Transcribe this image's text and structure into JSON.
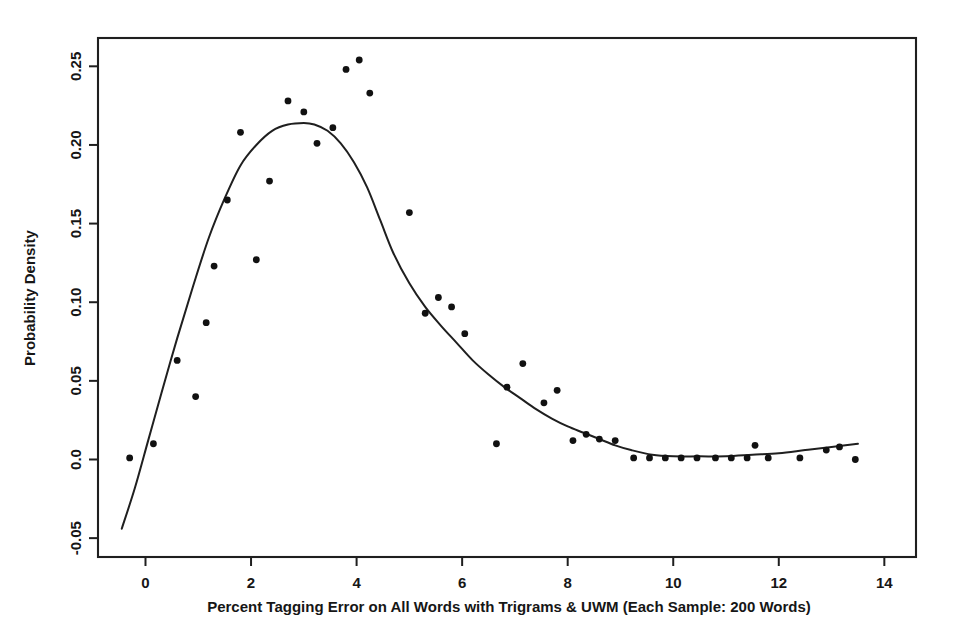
{
  "chart_data": {
    "type": "scatter",
    "title": "",
    "subtitle": "",
    "xlabel": "Percent Tagging Error on All Words with Trigrams & UWM (Each Sample: 200 Words)",
    "ylabel": "Probability Density",
    "xlim": [
      -0.9,
      14.6
    ],
    "ylim": [
      -0.062,
      0.268
    ],
    "grid": false,
    "legend": null,
    "xticks": [
      0,
      2,
      4,
      6,
      8,
      10,
      12,
      14
    ],
    "xtick_labels": [
      "0",
      "2",
      "4",
      "6",
      "8",
      "10",
      "12",
      "14"
    ],
    "yticks": [
      -0.05,
      0.0,
      0.05,
      0.1,
      0.15,
      0.2,
      0.25
    ],
    "ytick_labels": [
      "-0.05",
      "0.0",
      "0.05",
      "0.10",
      "0.15",
      "0.20",
      "0.25"
    ],
    "marker_color": "#111111",
    "line_color": "#1f1f1f",
    "frame_color": "#1f1f1f",
    "background_color": "#ffffff",
    "series": [
      {
        "name": "Empirical density points",
        "type": "scatter",
        "points": [
          [
            -0.3,
            0.001
          ],
          [
            0.15,
            0.01
          ],
          [
            0.6,
            0.063
          ],
          [
            0.95,
            0.04
          ],
          [
            1.15,
            0.087
          ],
          [
            1.3,
            0.123
          ],
          [
            1.55,
            0.165
          ],
          [
            1.8,
            0.208
          ],
          [
            2.1,
            0.127
          ],
          [
            2.35,
            0.177
          ],
          [
            2.7,
            0.228
          ],
          [
            3.0,
            0.221
          ],
          [
            3.25,
            0.201
          ],
          [
            3.55,
            0.211
          ],
          [
            3.8,
            0.248
          ],
          [
            4.05,
            0.254
          ],
          [
            4.25,
            0.233
          ],
          [
            5.0,
            0.157
          ],
          [
            5.3,
            0.093
          ],
          [
            5.55,
            0.103
          ],
          [
            5.8,
            0.097
          ],
          [
            6.05,
            0.08
          ],
          [
            6.65,
            0.01
          ],
          [
            6.85,
            0.046
          ],
          [
            7.15,
            0.061
          ],
          [
            7.55,
            0.036
          ],
          [
            7.8,
            0.044
          ],
          [
            8.1,
            0.012
          ],
          [
            8.35,
            0.016
          ],
          [
            8.6,
            0.013
          ],
          [
            8.9,
            0.012
          ],
          [
            9.25,
            0.001
          ],
          [
            9.55,
            0.001
          ],
          [
            9.85,
            0.001
          ],
          [
            10.15,
            0.001
          ],
          [
            10.45,
            0.001
          ],
          [
            10.8,
            0.001
          ],
          [
            11.1,
            0.001
          ],
          [
            11.4,
            0.001
          ],
          [
            11.55,
            0.009
          ],
          [
            11.8,
            0.001
          ],
          [
            12.4,
            0.001
          ],
          [
            12.9,
            0.006
          ],
          [
            13.15,
            0.008
          ],
          [
            13.45,
            0.0
          ]
        ]
      },
      {
        "name": "Fitted density curve",
        "type": "line",
        "points": [
          [
            -0.45,
            -0.044
          ],
          [
            -0.2,
            -0.018
          ],
          [
            0.05,
            0.012
          ],
          [
            0.3,
            0.042
          ],
          [
            0.6,
            0.077
          ],
          [
            0.9,
            0.11
          ],
          [
            1.2,
            0.141
          ],
          [
            1.5,
            0.166
          ],
          [
            1.8,
            0.187
          ],
          [
            2.1,
            0.2
          ],
          [
            2.4,
            0.209
          ],
          [
            2.7,
            0.213
          ],
          [
            3.0,
            0.214
          ],
          [
            3.2,
            0.213
          ],
          [
            3.45,
            0.209
          ],
          [
            3.7,
            0.201
          ],
          [
            3.95,
            0.189
          ],
          [
            4.2,
            0.173
          ],
          [
            4.45,
            0.152
          ],
          [
            4.7,
            0.131
          ],
          [
            5.0,
            0.112
          ],
          [
            5.3,
            0.097
          ],
          [
            5.6,
            0.085
          ],
          [
            5.9,
            0.074
          ],
          [
            6.2,
            0.063
          ],
          [
            6.5,
            0.054
          ],
          [
            6.8,
            0.046
          ],
          [
            7.1,
            0.039
          ],
          [
            7.4,
            0.032
          ],
          [
            7.7,
            0.026
          ],
          [
            8.0,
            0.021
          ],
          [
            8.3,
            0.017
          ],
          [
            8.6,
            0.013
          ],
          [
            8.9,
            0.009
          ],
          [
            9.2,
            0.006
          ],
          [
            9.6,
            0.003
          ],
          [
            10.0,
            0.002
          ],
          [
            10.5,
            0.002
          ],
          [
            11.0,
            0.002
          ],
          [
            11.5,
            0.003
          ],
          [
            12.0,
            0.004
          ],
          [
            12.5,
            0.006
          ],
          [
            13.0,
            0.008
          ],
          [
            13.5,
            0.01
          ]
        ]
      }
    ]
  },
  "axes": {
    "x_title": "Percent Tagging Error on All Words with Trigrams & UWM (Each Sample: 200 Words)",
    "y_title": "Probability Density"
  }
}
